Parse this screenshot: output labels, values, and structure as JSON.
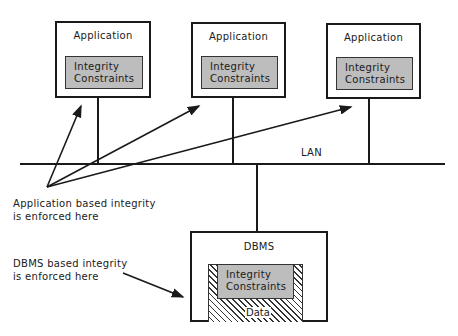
{
  "applications": [
    {
      "title": "Application",
      "constraints_line1": "Integrity",
      "constraints_line2": "Constraints"
    },
    {
      "title": "Application",
      "constraints_line1": "Integrity",
      "constraints_line2": "Constraints"
    },
    {
      "title": "Application",
      "constraints_line1": "Integrity",
      "constraints_line2": "Constraints"
    }
  ],
  "network": {
    "label": "LAN"
  },
  "dbms": {
    "title": "DBMS",
    "constraints_line1": "Integrity",
    "constraints_line2": "Constraints",
    "data_label": "Data"
  },
  "annotations": {
    "app_line1": "Application based integrity",
    "app_line2": "is enforced here",
    "dbms_line1": "DBMS based integrity",
    "dbms_line2": "is enforced here"
  }
}
